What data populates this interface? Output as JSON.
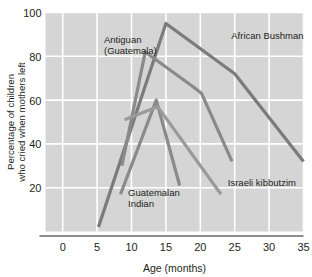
{
  "chart_data": {
    "type": "line",
    "title": "",
    "xlabel": "Age (months)",
    "ylabel": "Percentage of children who cried when mothers left",
    "ylabel_line1": "Percentage of children",
    "ylabel_line2": "who cried when mothers left",
    "xlim": [
      -2.5,
      35
    ],
    "ylim": [
      0,
      100
    ],
    "xticks": [
      0,
      5,
      10,
      15,
      20,
      25,
      30,
      35
    ],
    "xtick_labels": [
      "0",
      "5",
      "10",
      "15",
      "20",
      "25",
      "30",
      "35"
    ],
    "yticks": [
      20,
      40,
      60,
      80,
      100
    ],
    "ytick_labels": [
      "20",
      "40",
      "60",
      "80",
      "100"
    ],
    "grid": true,
    "grid_color": "#ffffff",
    "plot_background": "#d5d5d5",
    "legend": "inline-annotations",
    "series": [
      {
        "name": "African Bushman",
        "color": "#7b7b7b",
        "label_x": 24.5,
        "label_y": 88,
        "points": [
          {
            "x": 5.2,
            "y": 2
          },
          {
            "x": 15.0,
            "y": 95
          },
          {
            "x": 25.0,
            "y": 72
          },
          {
            "x": 35.0,
            "y": 32
          }
        ]
      },
      {
        "name": "Antiguan (Guatemala)",
        "color": "#8a8a8a",
        "label_line1": "Antiguan",
        "label_line2": "(Guatemala)",
        "label_x": 6.0,
        "label_y": 86,
        "points": [
          {
            "x": 8.6,
            "y": 30
          },
          {
            "x": 12.0,
            "y": 82
          },
          {
            "x": 19.0,
            "y": 66
          },
          {
            "x": 20.2,
            "y": 63
          },
          {
            "x": 24.6,
            "y": 32
          }
        ]
      },
      {
        "name": "Guatemalan Indian",
        "color": "#8a8a8a",
        "label_line1": "Guatemalan",
        "label_line2": "Indian",
        "label_x": 9.5,
        "label_y": 16,
        "points": [
          {
            "x": 8.4,
            "y": 17
          },
          {
            "x": 13.6,
            "y": 60
          },
          {
            "x": 17.0,
            "y": 21
          }
        ]
      },
      {
        "name": "Israeli kibbutzim",
        "color": "#9a9a9a",
        "label_x": 24.0,
        "label_y": 21,
        "points": [
          {
            "x": 9.0,
            "y": 51
          },
          {
            "x": 13.8,
            "y": 57
          },
          {
            "x": 23.0,
            "y": 17
          }
        ]
      }
    ]
  }
}
